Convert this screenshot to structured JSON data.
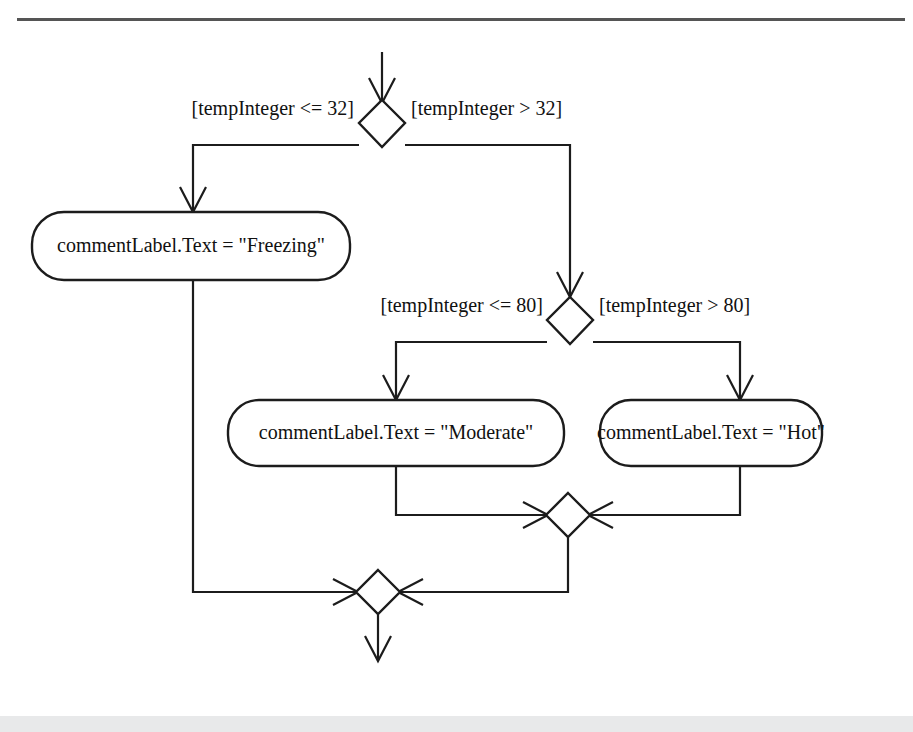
{
  "diagram": {
    "type": "uml-activity-diagram",
    "stroke_color": "#1c1c1c",
    "background_color": "#ffffff",
    "rule_color": "#555555",
    "footer_band_color": "#e8e9ea"
  },
  "decisions": [
    {
      "id": "decision-temp-32",
      "center_x": 382,
      "center_y": 123,
      "guard_left": "[tempInteger <= 32]",
      "guard_right": "[tempInteger > 32]"
    },
    {
      "id": "decision-temp-80",
      "center_x": 570,
      "center_y": 320,
      "guard_left": "[tempInteger <= 80]",
      "guard_right": "[tempInteger > 80]"
    }
  ],
  "actions": [
    {
      "id": "action-freezing",
      "label": "commentLabel.Text = \"Freezing\"",
      "x": 32,
      "y": 212,
      "width": 318,
      "height": 68
    },
    {
      "id": "action-moderate",
      "label": "commentLabel.Text = \"Moderate\"",
      "x": 228,
      "y": 400,
      "width": 336,
      "height": 66
    },
    {
      "id": "action-hot",
      "label": "commentLabel.Text = \"Hot\"",
      "x": 600,
      "y": 400,
      "width": 222,
      "height": 66
    }
  ],
  "merges": [
    {
      "id": "merge-inner",
      "center_x": 568,
      "center_y": 515
    },
    {
      "id": "merge-outer",
      "center_x": 378,
      "center_y": 592
    }
  ],
  "flows": {
    "incoming_top": "flow-into-decision-temp-32",
    "outgoing_bottom": "flow-out-of-merge-outer"
  }
}
